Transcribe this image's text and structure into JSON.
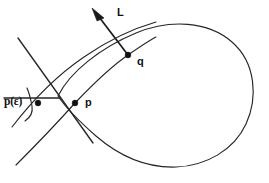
{
  "figure": {
    "background_color": "#ffffff",
    "stroke_color": "#262626",
    "width": 269,
    "height": 183,
    "labels": {
      "vector_L": "L",
      "point_q": "q",
      "point_p": "p",
      "point_p_epsilon": "p(ε)"
    },
    "points": [
      {
        "name": "q",
        "label": "q",
        "x": 128,
        "y": 55
      },
      {
        "name": "p",
        "label": "p",
        "x": 75,
        "y": 103
      },
      {
        "name": "p-epsilon",
        "label": "p(ε)",
        "x": 38,
        "y": 103
      }
    ],
    "elements": [
      {
        "name": "closed-curve",
        "kind": "curve",
        "description": "large teardrop shaped closed curve"
      },
      {
        "name": "secant-line",
        "kind": "curve",
        "description": "line through p and q extending to lower left"
      },
      {
        "name": "upper-arc",
        "kind": "curve",
        "description": "arc above the secant line"
      },
      {
        "name": "chord-line",
        "kind": "straight",
        "description": "straight line through p(epsilon) descending to the right"
      },
      {
        "name": "crossing-line",
        "kind": "straight",
        "description": "straight line from upper left to lower right crossing the others"
      },
      {
        "name": "short-arc",
        "kind": "curve",
        "description": "short arc through p(epsilon)"
      },
      {
        "name": "normal-vector",
        "kind": "vector",
        "description": "arrow at q pointing up and to the left labelled L"
      }
    ]
  }
}
